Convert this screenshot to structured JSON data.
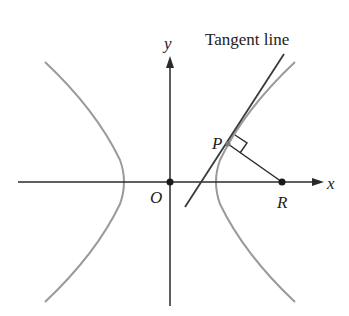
{
  "diagram": {
    "title_label": "Tangent line",
    "axes": {
      "x_label": "x",
      "y_label": "y",
      "origin_label": "O"
    },
    "points": {
      "P": "P",
      "R": "R",
      "O": "O"
    },
    "elements": [
      "hyperbola (two branches)",
      "tangent line at P",
      "segment PR perpendicular to tangent",
      "right-angle marker at P"
    ],
    "colors": {
      "axes": "#2a2a2a",
      "hyperbola": "#9a9a9a",
      "tangent": "#3a3a3a",
      "segment": "#2a2a2a",
      "points": "#1a1a1a"
    }
  }
}
